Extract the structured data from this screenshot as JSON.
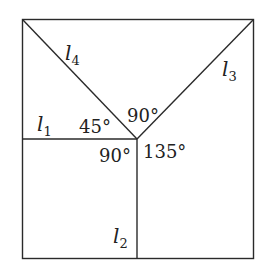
{
  "diagram": {
    "lines": [
      {
        "id": "l1",
        "label": "l",
        "sub": "1"
      },
      {
        "id": "l2",
        "label": "l",
        "sub": "2"
      },
      {
        "id": "l3",
        "label": "l",
        "sub": "3"
      },
      {
        "id": "l4",
        "label": "l",
        "sub": "4"
      }
    ],
    "angles": {
      "a45": "45°",
      "a90_top": "90°",
      "a90_bottom": "90°",
      "a135": "135°"
    }
  }
}
